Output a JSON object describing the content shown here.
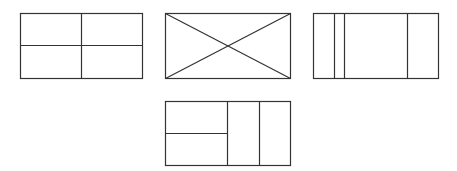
{
  "canvas": {
    "width": 457,
    "height": 171,
    "background": "#ffffff",
    "stroke": "#333333"
  },
  "diagrams": [
    {
      "id": "grid-2x2",
      "description": "Rectangle divided into four equal quadrants",
      "rect": {
        "x": 20,
        "y": 13,
        "w": 122,
        "h": 65
      },
      "lines": [
        {
          "x1": 81,
          "y1": 13,
          "x2": 81,
          "y2": 78
        },
        {
          "x1": 20,
          "y1": 45,
          "x2": 142,
          "y2": 45
        }
      ]
    },
    {
      "id": "crossed-rect",
      "description": "Rectangle with both diagonals drawn",
      "rect": {
        "x": 165,
        "y": 13,
        "w": 125,
        "h": 65
      },
      "lines": [
        {
          "x1": 165,
          "y1": 13,
          "x2": 290,
          "y2": 78
        },
        {
          "x1": 165,
          "y1": 78,
          "x2": 290,
          "y2": 13
        }
      ]
    },
    {
      "id": "vertical-strips",
      "description": "Rectangle divided by three vertical lines into four strips",
      "rect": {
        "x": 313,
        "y": 13,
        "w": 125,
        "h": 65
      },
      "lines": [
        {
          "x1": 334,
          "y1": 13,
          "x2": 334,
          "y2": 78
        },
        {
          "x1": 344,
          "y1": 13,
          "x2": 344,
          "y2": 78
        },
        {
          "x1": 407,
          "y1": 13,
          "x2": 407,
          "y2": 78
        }
      ]
    },
    {
      "id": "split-left-two-columns",
      "description": "Rectangle with left half split horizontally and right part split into two columns",
      "rect": {
        "x": 165,
        "y": 101,
        "w": 125,
        "h": 64
      },
      "lines": [
        {
          "x1": 227,
          "y1": 101,
          "x2": 227,
          "y2": 165
        },
        {
          "x1": 259,
          "y1": 101,
          "x2": 259,
          "y2": 165
        },
        {
          "x1": 165,
          "y1": 133,
          "x2": 227,
          "y2": 133
        }
      ]
    }
  ]
}
